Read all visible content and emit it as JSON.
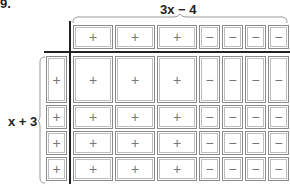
{
  "problem": {
    "number": "9."
  },
  "labels": {
    "top": "3x − 4",
    "side": "x + 3"
  },
  "top_row": [
    {
      "type": "x",
      "sign": "+"
    },
    {
      "type": "x",
      "sign": "+"
    },
    {
      "type": "x",
      "sign": "+"
    },
    {
      "type": "unit",
      "sign": "−"
    },
    {
      "type": "unit",
      "sign": "−"
    },
    {
      "type": "unit",
      "sign": "−"
    },
    {
      "type": "unit",
      "sign": "−"
    }
  ],
  "left_col": [
    {
      "type": "x",
      "sign": "+"
    },
    {
      "type": "unit",
      "sign": "+"
    },
    {
      "type": "unit",
      "sign": "+"
    },
    {
      "type": "unit",
      "sign": "+"
    }
  ],
  "grid": [
    [
      "+",
      "+",
      "+",
      "−",
      "−",
      "−",
      "−"
    ],
    [
      "+",
      "+",
      "+",
      "−",
      "−",
      "−",
      "−"
    ],
    [
      "+",
      "+",
      "+",
      "−",
      "−",
      "−",
      "−"
    ],
    [
      "+",
      "+",
      "+",
      "−",
      "−",
      "−",
      "−"
    ]
  ],
  "colors": {
    "tile_border": "#8a8a8a",
    "axis": "#222222",
    "sign": "#777777"
  }
}
